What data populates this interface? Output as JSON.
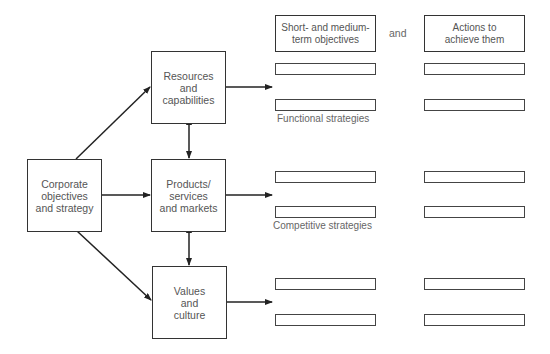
{
  "header": {
    "left": "Short- and medium-\nterm objectives",
    "connector": "and",
    "right": "Actions to\nachieve them"
  },
  "nodes": {
    "corporate": "Corporate\nobjectives\nand strategy",
    "resources": "Resources\nand\ncapabilities",
    "products": "Products/\nservices\nand markets",
    "values": "Values\nand\nculture"
  },
  "group_labels": {
    "functional": "Functional strategies",
    "competitive": "Competitive strategies"
  },
  "colors": {
    "line": "#222222",
    "text": "#555555"
  }
}
